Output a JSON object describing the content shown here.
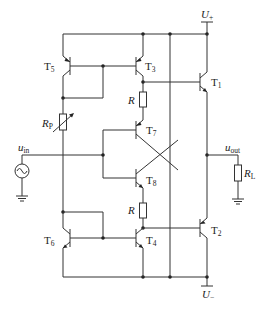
{
  "diagram": {
    "type": "circuit-schematic",
    "supply": {
      "positive": {
        "symbol": "U",
        "sub": "+"
      },
      "negative": {
        "symbol": "U",
        "sub": "−"
      }
    },
    "input": {
      "symbol": "u",
      "sub": "in"
    },
    "output": {
      "symbol": "u",
      "sub": "out"
    },
    "transistors": [
      {
        "id": "T1",
        "label": "T",
        "sub": "1",
        "type": "NPN"
      },
      {
        "id": "T2",
        "label": "T",
        "sub": "2",
        "type": "PNP"
      },
      {
        "id": "T3",
        "label": "T",
        "sub": "3",
        "type": "PNP"
      },
      {
        "id": "T4",
        "label": "T",
        "sub": "4",
        "type": "NPN"
      },
      {
        "id": "T5",
        "label": "T",
        "sub": "5",
        "type": "PNP"
      },
      {
        "id": "T6",
        "label": "T",
        "sub": "6",
        "type": "NPN"
      },
      {
        "id": "T7",
        "label": "T",
        "sub": "7",
        "type": "PNP"
      },
      {
        "id": "T8",
        "label": "T",
        "sub": "8",
        "type": "NPN"
      }
    ],
    "resistors": [
      {
        "id": "R_upper",
        "label": "R",
        "sub": ""
      },
      {
        "id": "R_lower",
        "label": "R",
        "sub": ""
      },
      {
        "id": "RP",
        "label": "R",
        "sub": "P",
        "variable": true
      },
      {
        "id": "RL",
        "label": "R",
        "sub": "L"
      }
    ],
    "source": {
      "type": "ac-voltage-source",
      "icon": "sine-source-icon"
    }
  }
}
